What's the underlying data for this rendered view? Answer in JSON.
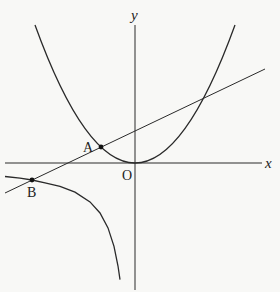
{
  "diagram": {
    "axes": {
      "x_label": "x",
      "y_label": "y",
      "origin_label": "O"
    },
    "points": [
      {
        "label": "A",
        "px": 101,
        "py": 147
      },
      {
        "label": "B",
        "px": 32,
        "py": 180
      }
    ],
    "curves": [
      "parabola",
      "hyperbola-branch",
      "line"
    ],
    "colors": {
      "stroke": "#2a2a2a",
      "background": "#f8f8f6"
    }
  }
}
